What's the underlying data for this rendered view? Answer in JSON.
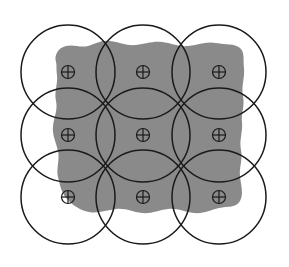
{
  "figure": {
    "width": 289,
    "height": 267,
    "background_color": "#ffffff"
  },
  "region": {
    "name": "target-region",
    "fill_color": "#8a8a8a",
    "stroke_color": "none",
    "description": "Irregular blob-shaped shaded area",
    "path": "M 56 62 C 54 55 58 48 66 46 C 74 44 80 48 88 46 C 96 44 100 40 110 41 C 120 42 126 46 136 45 C 146 44 152 41 162 42 C 172 43 178 47 188 46 C 198 45 206 41 216 43 C 226 45 234 43 240 48 C 245 52 243 60 244 68 C 245 78 241 86 243 96 C 245 106 241 113 242 122 C 243 132 239 140 241 150 C 243 160 239 167 240 176 C 241 186 244 194 240 201 C 236 208 228 206 219 208 C 210 210 204 214 194 213 C 184 212 178 208 168 209 C 158 210 152 214 142 213 C 132 212 126 208 116 209 C 106 210 98 214 89 212 C 80 210 74 206 68 200 C 62 194 60 186 58 177 C 56 168 60 160 58 151 C 56 142 52 135 53 126 C 54 117 58 110 56 101 C 54 92 58 84 57 75 C 56 68 57 66 56 62 Z"
  },
  "circles": {
    "radius": 47,
    "stroke_color": "#1a1a1a",
    "stroke_width": 1.5,
    "fill": "none",
    "count": 9,
    "items": [
      {
        "name": "circle-r1-c1",
        "cx": 68,
        "cy": 72,
        "row": 1,
        "col": 1
      },
      {
        "name": "circle-r1-c2",
        "cx": 143,
        "cy": 72,
        "row": 1,
        "col": 2
      },
      {
        "name": "circle-r1-c3",
        "cx": 219,
        "cy": 72,
        "row": 1,
        "col": 3
      },
      {
        "name": "circle-r2-c1",
        "cx": 68,
        "cy": 135,
        "row": 2,
        "col": 1
      },
      {
        "name": "circle-r2-c2",
        "cx": 143,
        "cy": 135,
        "row": 2,
        "col": 2
      },
      {
        "name": "circle-r2-c3",
        "cx": 219,
        "cy": 135,
        "row": 2,
        "col": 3
      },
      {
        "name": "circle-r3-c1",
        "cx": 68,
        "cy": 197,
        "row": 3,
        "col": 1
      },
      {
        "name": "circle-r3-c2",
        "cx": 143,
        "cy": 197,
        "row": 3,
        "col": 2
      },
      {
        "name": "circle-r3-c3",
        "cx": 219,
        "cy": 197,
        "row": 3,
        "col": 3
      }
    ]
  },
  "markers": {
    "glyph_name": "crosshair-circle-icon",
    "glyph": "⊕",
    "ring_radius": 6.5,
    "stroke_color": "#1a1a1a",
    "stroke_width": 1.2,
    "count": 9,
    "items": [
      {
        "name": "marker-r1-c1",
        "cx": 68,
        "cy": 72
      },
      {
        "name": "marker-r1-c2",
        "cx": 143,
        "cy": 72
      },
      {
        "name": "marker-r1-c3",
        "cx": 219,
        "cy": 72
      },
      {
        "name": "marker-r2-c1",
        "cx": 68,
        "cy": 135
      },
      {
        "name": "marker-r2-c2",
        "cx": 143,
        "cy": 135
      },
      {
        "name": "marker-r2-c3",
        "cx": 219,
        "cy": 135
      },
      {
        "name": "marker-r3-c1",
        "cx": 68,
        "cy": 197
      },
      {
        "name": "marker-r3-c2",
        "cx": 143,
        "cy": 197
      },
      {
        "name": "marker-r3-c3",
        "cx": 219,
        "cy": 197
      }
    ]
  },
  "labels": {
    "text_items": []
  }
}
